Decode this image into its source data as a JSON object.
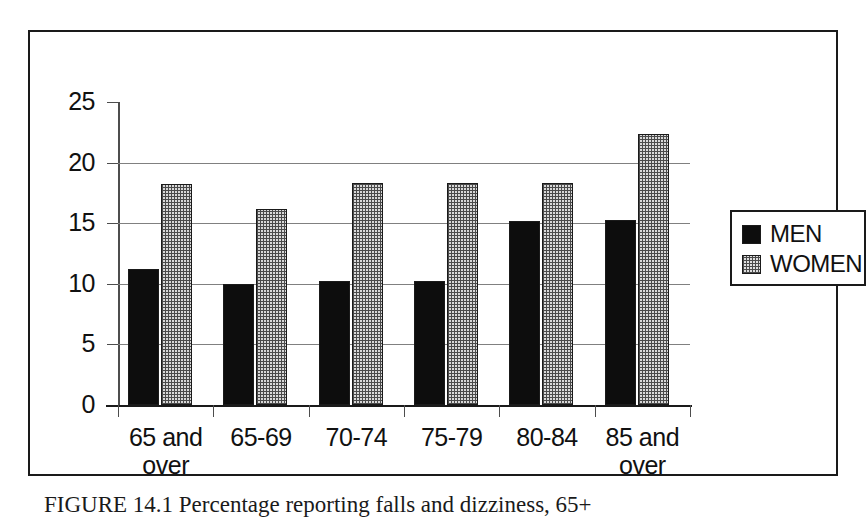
{
  "figure": {
    "caption": "FIGURE 14.1   Percentage reporting falls and dizziness, 65+"
  },
  "legend": {
    "position": "right",
    "entries": [
      {
        "label": "MEN",
        "swatch": "solid-black-swatch"
      },
      {
        "label": "WOMEN",
        "swatch": "crosshatch-gray-swatch"
      }
    ]
  },
  "axes": {
    "y_ticks": [
      "25",
      "20",
      "15",
      "10",
      "5",
      "0"
    ],
    "x_labels": [
      "65 and\nover",
      "65-69",
      "70-74",
      "75-79",
      "80-84",
      "85 and\nover"
    ]
  },
  "colors": {
    "men": "#0d0d0d",
    "women": "#d8d8d8",
    "axis": "#1a1a1a",
    "grid": "#808080",
    "background": "#ffffff"
  },
  "chart_data": {
    "type": "bar",
    "title": "",
    "xlabel": "",
    "ylabel": "",
    "ylim": [
      0,
      25
    ],
    "yticks": [
      0,
      5,
      10,
      15,
      20,
      25
    ],
    "grid": true,
    "legend_position": "right",
    "categories": [
      "65 and over",
      "65-69",
      "70-74",
      "75-79",
      "80-84",
      "85 and over"
    ],
    "series": [
      {
        "name": "MEN",
        "values": [
          11.2,
          10.0,
          10.2,
          10.2,
          15.2,
          15.3
        ]
      },
      {
        "name": "WOMEN",
        "values": [
          18.2,
          16.2,
          18.3,
          18.3,
          18.3,
          22.4
        ]
      }
    ]
  }
}
